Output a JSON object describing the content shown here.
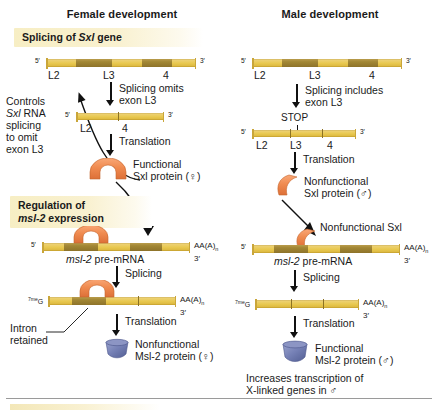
{
  "figure": {
    "columns": [
      {
        "title": "Female development"
      },
      {
        "title": "Male development"
      }
    ],
    "banners": {
      "splicing": "Splicing of Sxl gene",
      "regulation_line1": "Regulation of",
      "regulation_line2": "msl-2 expression"
    },
    "gene_labels": {
      "l2": "L2",
      "l3": "L3",
      "four": "4",
      "stop": "STOP"
    },
    "ends": {
      "five_prime": "5′",
      "three_prime": "3′",
      "cap": "7meG",
      "cap_sup": "7me",
      "cap_base": "G",
      "polyA": "AA(A)n 3′"
    },
    "female": {
      "side_note": [
        "Controls",
        "Sxl RNA",
        "splicing",
        "to omit",
        "exon L3"
      ],
      "step1_line1": "Splicing omits",
      "step1_line2": "exon L3",
      "step2": "Translation",
      "protein1_line1": "Functional",
      "protein1_line2": "Sxl protein (♀)",
      "premrna_label": "msl-2 pre-mRNA",
      "step3": "Splicing",
      "intron_note_line1": "Intron",
      "intron_note_line2": "retained",
      "step4": "Translation",
      "protein2_line1": "Nonfunctional",
      "protein2_line2": "Msl-2 protein (♀)"
    },
    "male": {
      "step1_line1": "Splicing includes",
      "step1_line2": "exon L3",
      "step2": "Translation",
      "protein1_line1": "Nonfunctional",
      "protein1_line2": "Sxl protein (♂)",
      "sxl_bound_label": "Nonfunctional Sxl",
      "premrna_label": "msl-2 pre-mRNA",
      "step3": "Splicing",
      "step4": "Translation",
      "protein2_line1": "Functional",
      "protein2_line2": "Msl-2 protein (♂)",
      "outcome_line1": "Increases transcription of",
      "outcome_line2": "X-linked genes in ♂"
    },
    "colors": {
      "rna_light": "#ecd06f",
      "rna_dark": "#9e8332",
      "sxl_protein": "#ef8b52",
      "msl2_protein": "#6f7bb0",
      "banner": "#f7eec4",
      "text": "#1a1a1a"
    }
  }
}
